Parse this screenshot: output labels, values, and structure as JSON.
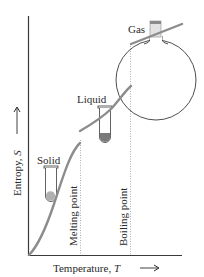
{
  "diagram": {
    "type": "entropy-vs-temperature",
    "axes": {
      "x_label": "Temperature, T",
      "x_label_text": "Temperature, ",
      "x_label_var": "T",
      "y_label": "Entropy, S",
      "y_label_text": "Entropy, ",
      "y_label_var": "S",
      "x_arrow": "⟶",
      "y_arrow": "⟶"
    },
    "phases": [
      {
        "name": "Solid",
        "label": "Solid"
      },
      {
        "name": "Liquid",
        "label": "Liquid"
      },
      {
        "name": "Gas",
        "label": "Gas"
      }
    ],
    "transitions": [
      {
        "name": "melting-point",
        "label": "Melting point"
      },
      {
        "name": "boiling-point",
        "label": "Boiling point"
      }
    ],
    "colors": {
      "axis": "#3a3a3a",
      "curve": "#8c8c8c",
      "dotted": "#9a9a9a",
      "container": "#3a3a3a",
      "solid_fill": "#a9a9a9",
      "liquid_fill": "#7a7a7a",
      "cap_fill": "#d8d8d8",
      "cap_band": "#8a8a8a"
    }
  }
}
